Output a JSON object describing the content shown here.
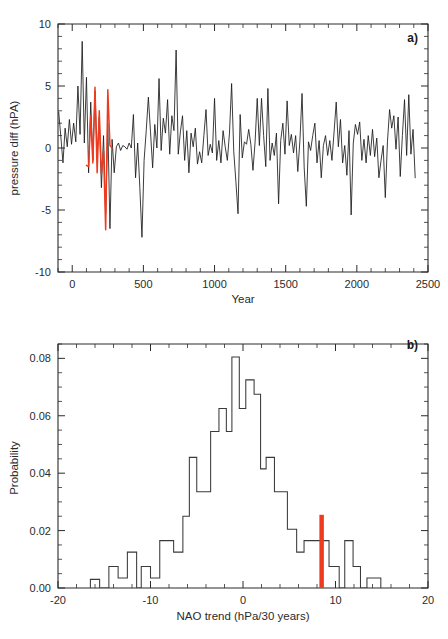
{
  "figure": {
    "panels": [
      {
        "id": "a",
        "label": "a)",
        "xlabel": "Year",
        "ylabel": "pressure diff (hPA)"
      },
      {
        "id": "b",
        "label": "b)",
        "xlabel": "NAO trend (hPa/30 years)",
        "ylabel": "Probability"
      }
    ],
    "colors": {
      "line": "#1a1a1a",
      "highlight": "#ee3b1f",
      "axis": "#2b2b2b"
    }
  },
  "chart_data": [
    {
      "type": "line",
      "panel": "a",
      "title": "",
      "xlabel": "Year",
      "ylabel": "pressure diff (hPA)",
      "xlim": [
        -100,
        2500
      ],
      "ylim": [
        -10,
        10
      ],
      "xticks": [
        0,
        500,
        1000,
        1500,
        2000,
        2500
      ],
      "xticklabels": [
        "0",
        "500",
        "1000",
        "1500",
        "2000",
        "2500"
      ],
      "yticks": [
        -10,
        -5,
        0,
        5,
        10
      ],
      "yticklabels": [
        "-10",
        "-5",
        "0",
        "5",
        "10"
      ],
      "minor_ticks_per_major_x": 5,
      "minor_ticks_per_major_y": 5,
      "grid": false,
      "legend": "none",
      "series": [
        {
          "name": "control-simulation",
          "color": "#1a1a1a",
          "x": [
            -95,
            -80,
            -65,
            -50,
            -35,
            -20,
            -5,
            10,
            25,
            40,
            55,
            70,
            85,
            100,
            115,
            130,
            145,
            160,
            175,
            190,
            205,
            220,
            235,
            250,
            265,
            280,
            295,
            310,
            325,
            340,
            355,
            370,
            385,
            400,
            415,
            430,
            445,
            460,
            475,
            490,
            505,
            520,
            535,
            550,
            565,
            580,
            595,
            610,
            625,
            640,
            655,
            670,
            685,
            700,
            715,
            730,
            745,
            760,
            775,
            790,
            805,
            820,
            835,
            850,
            865,
            880,
            895,
            910,
            925,
            940,
            955,
            970,
            985,
            1000,
            1015,
            1030,
            1045,
            1060,
            1075,
            1090,
            1105,
            1120,
            1135,
            1150,
            1165,
            1180,
            1195,
            1210,
            1225,
            1240,
            1255,
            1270,
            1285,
            1300,
            1315,
            1330,
            1345,
            1360,
            1375,
            1390,
            1405,
            1420,
            1435,
            1450,
            1465,
            1480,
            1495,
            1510,
            1525,
            1540,
            1555,
            1570,
            1585,
            1600,
            1615,
            1630,
            1645,
            1660,
            1675,
            1690,
            1705,
            1720,
            1735,
            1750,
            1765,
            1780,
            1795,
            1810,
            1825,
            1840,
            1855,
            1870,
            1885,
            1900,
            1915,
            1930,
            1945,
            1960,
            1975,
            1990,
            2005,
            2020,
            2035,
            2050,
            2065,
            2080,
            2095,
            2110,
            2125,
            2140,
            2155,
            2170,
            2185,
            2200,
            2215,
            2230,
            2245,
            2260,
            2275,
            2290,
            2305,
            2320,
            2335,
            2350,
            2365,
            2380,
            2395,
            2410,
            2425,
            2440
          ],
          "y": [
            2.9,
            0.9,
            -1.2,
            1.6,
            0.1,
            2.3,
            0.3,
            2.0,
            0.5,
            5.0,
            1.1,
            8.6,
            0.4,
            5.7,
            -2.0,
            3.7,
            -1.0,
            4.6,
            -0.6,
            2.5,
            -3.2,
            1.0,
            -5.3,
            2.0,
            -6.5,
            0.7,
            -2.0,
            0.1,
            0.4,
            -0.2,
            0.2,
            0.1,
            -0.1,
            0.4,
            0.0,
            2.7,
            -2.4,
            0.4,
            -3.2,
            -7.2,
            -1.0,
            1.4,
            4.1,
            1.3,
            -1.6,
            1.9,
            0.0,
            5.6,
            -0.2,
            2.4,
            1.2,
            3.9,
            -0.5,
            2.6,
            1.4,
            7.9,
            -0.5,
            1.3,
            2.6,
            -1.0,
            1.4,
            -2.0,
            1.2,
            0.1,
            1.6,
            -1.3,
            -0.3,
            -1.2,
            1.0,
            3.1,
            -0.6,
            0.3,
            -0.4,
            4.0,
            -1.0,
            0.6,
            -1.2,
            1.4,
            0.1,
            -1.0,
            1.2,
            5.2,
            -0.3,
            -2.7,
            -5.3,
            2.7,
            -0.8,
            0.5,
            0.3,
            1.5,
            0.3,
            -1.8,
            0.5,
            4.0,
            0.2,
            4.0,
            1.0,
            -1.5,
            4.8,
            -1.0,
            0.4,
            -0.6,
            1.2,
            -4.5,
            0.6,
            2.0,
            -0.5,
            3.8,
            0.2,
            1.1,
            -0.4,
            1.0,
            -1.9,
            0.6,
            4.4,
            -1.6,
            -4.7,
            0.5,
            -0.2,
            1.0,
            2.0,
            -1.2,
            0.6,
            -2.4,
            0.2,
            1.0,
            -0.6,
            0.6,
            -1.0,
            1.3,
            3.7,
            0.1,
            2.3,
            -1.2,
            0.2,
            -2.2,
            1.4,
            -5.4,
            0.4,
            1.9,
            1.1,
            2.1,
            -1.0,
            0.7,
            -1.2,
            1.0,
            -0.6,
            1.5,
            -0.7,
            0.8,
            -2.4,
            -1.0,
            0.2,
            -4.0,
            0.5,
            3.1,
            1.6,
            2.6,
            -0.1,
            2.5,
            -2.3,
            1.0,
            3.9,
            -0.6,
            4.3,
            -0.5,
            1.5,
            -2.4
          ]
        },
        {
          "name": "forced-segment",
          "color": "#ee3b1f",
          "x": [
            100,
            115,
            130,
            145,
            160,
            175,
            190,
            205,
            220,
            235,
            250,
            265,
            280
          ],
          "y": [
            -1.4,
            -1.5,
            2.6,
            -1.2,
            4.9,
            -2.0,
            3.0,
            -2.1,
            -0.2,
            -6.6,
            4.7,
            0.2,
            0.0
          ]
        }
      ]
    },
    {
      "type": "bar",
      "panel": "b",
      "title": "",
      "xlabel": "NAO trend (hPa/30 years)",
      "ylabel": "Probability",
      "xlim": [
        -20,
        20
      ],
      "ylim": [
        0.0,
        0.085
      ],
      "xticks": [
        -20,
        -10,
        0,
        10,
        20
      ],
      "xticklabels": [
        "-20",
        "-10",
        "0",
        "10",
        "20"
      ],
      "yticks": [
        0.0,
        0.02,
        0.04,
        0.06,
        0.08
      ],
      "yticklabels": [
        "0.00",
        "0.02",
        "0.04",
        "0.06",
        "0.08"
      ],
      "minor_ticks_per_major_x": 5,
      "minor_ticks_per_major_y": 4,
      "grid": false,
      "legend": "none",
      "histogram_style": "step-outline",
      "bin_width": 1.0,
      "bin_left_edges": [
        -17,
        -16,
        -15,
        -14,
        -13,
        -12,
        -11,
        -10,
        -9,
        -8,
        -7,
        -6,
        -5,
        -4,
        -3,
        -2,
        -1,
        0,
        1,
        2,
        3,
        4,
        5,
        6,
        7,
        8,
        9,
        10,
        11,
        12,
        13,
        14
      ],
      "values": [
        0.0,
        0.003,
        0.0,
        0.0075,
        0.0035,
        0.0125,
        0.0,
        0.0075,
        0.0035,
        0.0165,
        0.0125,
        0.0125,
        0.025,
        0.0455,
        0.0335,
        0.0545,
        0.0625,
        0.0545,
        0.0805,
        0.0625,
        0.0725,
        0.0675,
        0.0415,
        0.0455,
        0.0335,
        0.0205,
        0.0125,
        0.0165,
        0.0165,
        0.0075,
        0.0,
        0.0165
      ],
      "bins_detailed": [
        {
          "left": -16.5,
          "right": -15.5,
          "value": 0.003
        },
        {
          "left": -14.5,
          "right": -13.5,
          "value": 0.0075
        },
        {
          "left": -13.5,
          "right": -12.5,
          "value": 0.0035
        },
        {
          "left": -12.5,
          "right": -11.5,
          "value": 0.0125
        },
        {
          "left": -11.0,
          "right": -10.0,
          "value": 0.0075
        },
        {
          "left": -10.0,
          "right": -9.0,
          "value": 0.0035
        },
        {
          "left": -9.0,
          "right": -7.5,
          "value": 0.0165
        },
        {
          "left": -7.5,
          "right": -6.5,
          "value": 0.0125
        },
        {
          "left": -6.5,
          "right": -5.8,
          "value": 0.025
        },
        {
          "left": -5.8,
          "right": -5.0,
          "value": 0.0455
        },
        {
          "left": -5.0,
          "right": -3.5,
          "value": 0.0335
        },
        {
          "left": -3.5,
          "right": -2.6,
          "value": 0.0545
        },
        {
          "left": -2.6,
          "right": -1.8,
          "value": 0.0625
        },
        {
          "left": -1.8,
          "right": -1.2,
          "value": 0.0545
        },
        {
          "left": -1.2,
          "right": -0.4,
          "value": 0.0805
        },
        {
          "left": -0.4,
          "right": 0.3,
          "value": 0.0625
        },
        {
          "left": 0.3,
          "right": 1.2,
          "value": 0.0725
        },
        {
          "left": 1.2,
          "right": 1.9,
          "value": 0.0675
        },
        {
          "left": 1.9,
          "right": 2.5,
          "value": 0.0415
        },
        {
          "left": 2.5,
          "right": 3.4,
          "value": 0.0455
        },
        {
          "left": 3.4,
          "right": 4.8,
          "value": 0.0335
        },
        {
          "left": 4.8,
          "right": 5.8,
          "value": 0.0205
        },
        {
          "left": 5.8,
          "right": 6.6,
          "value": 0.0125
        },
        {
          "left": 6.6,
          "right": 9.3,
          "value": 0.0165
        },
        {
          "left": 9.3,
          "right": 10.4,
          "value": 0.0075
        },
        {
          "left": 10.4,
          "right": 11.0,
          "value": 0.0
        },
        {
          "left": 11.0,
          "right": 11.9,
          "value": 0.0165
        },
        {
          "left": 11.9,
          "right": 12.7,
          "value": 0.0075
        },
        {
          "left": 13.4,
          "right": 14.9,
          "value": 0.0035
        }
      ],
      "marker": {
        "name": "observed-nao-trend",
        "x": 8.5,
        "y_top": 0.0255,
        "color": "#ee3b1f",
        "label": ""
      }
    }
  ]
}
